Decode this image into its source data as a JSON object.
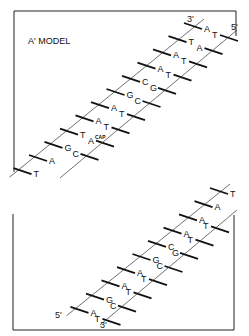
{
  "title": "A' MODEL",
  "upper_segment": {
    "end_labels": {
      "left_strand_top": "3'",
      "right_strand_top": "5'"
    },
    "pairs": [
      {
        "left": "A",
        "right": "T"
      },
      {
        "left": "T",
        "right": "A"
      },
      {
        "left": "A",
        "right": "T"
      },
      {
        "left": "A",
        "right": "T"
      },
      {
        "left": "C",
        "right": "G"
      },
      {
        "left": "G",
        "right": "C"
      },
      {
        "left": "A",
        "right": "T"
      },
      {
        "left": "A",
        "right": "T"
      },
      {
        "left": "T",
        "right": "A",
        "right_superscript": "CAP"
      },
      {
        "left": "G",
        "right": "C"
      },
      {
        "left": "A",
        "right": ""
      },
      {
        "left": "T",
        "right": ""
      }
    ]
  },
  "lower_segment": {
    "end_labels": {
      "left_strand_bottom": "5'",
      "right_strand_bottom": "3'"
    },
    "pairs": [
      {
        "left": "T",
        "right": ""
      },
      {
        "left": "A",
        "right": ""
      },
      {
        "left": "A",
        "right": "T"
      },
      {
        "left": "A",
        "right": "T"
      },
      {
        "left": "C",
        "right": "G"
      },
      {
        "left": "G",
        "right": "C"
      },
      {
        "left": "A",
        "right": "T"
      },
      {
        "left": "A",
        "right": "T"
      },
      {
        "left": "G",
        "right": "C"
      },
      {
        "left": "A",
        "right": "T"
      }
    ]
  },
  "colors": {
    "ink": "#111111",
    "background": "#ffffff"
  }
}
